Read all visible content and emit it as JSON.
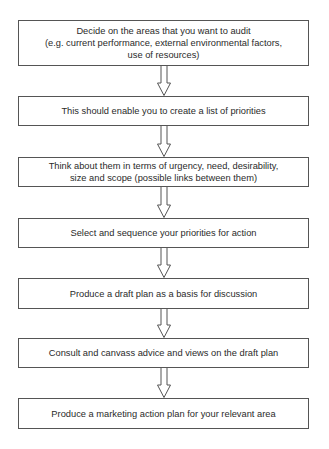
{
  "diagram": {
    "type": "vertical flowchart",
    "steps": [
      {
        "lines": [
          "Decide on the areas that you want to audit",
          "(e.g. current performance, external environmental factors,",
          "use of resources)"
        ]
      },
      {
        "lines": [
          "This should enable you to create a list of priorities"
        ]
      },
      {
        "lines": [
          "Think about them in terms of urgency, need, desirability,",
          "size and scope (possible links between them)"
        ]
      },
      {
        "lines": [
          "Select and sequence your priorities for action"
        ]
      },
      {
        "lines": [
          "Produce a draft plan as a basis for discussion"
        ]
      },
      {
        "lines": [
          "Consult and canvass advice and views on the draft plan"
        ]
      },
      {
        "lines": [
          "Produce a marketing action plan for your relevant area"
        ]
      }
    ],
    "connectors": [
      {
        "from": 0,
        "to": 1,
        "style": "hollow-down-arrow"
      },
      {
        "from": 1,
        "to": 2,
        "style": "hollow-down-arrow"
      },
      {
        "from": 2,
        "to": 3,
        "style": "hollow-down-arrow"
      },
      {
        "from": 3,
        "to": 4,
        "style": "hollow-down-arrow"
      },
      {
        "from": 4,
        "to": 5,
        "style": "hollow-down-arrow"
      },
      {
        "from": 5,
        "to": 6,
        "style": "hollow-down-arrow"
      }
    ],
    "colors": {
      "border": "#555555",
      "text": "#2a2a2a",
      "background": "#ffffff"
    }
  }
}
